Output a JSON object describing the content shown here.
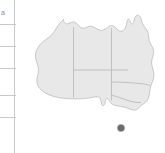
{
  "page": {
    "background_color": "#ffffff",
    "width": 165,
    "height": 153
  },
  "table_fragment": {
    "name": "cropped-table-column",
    "rule_color": "#c9c9c9",
    "cells": [
      {
        "text": "a",
        "top": 9
      },
      {
        "text": "",
        "top": 27
      },
      {
        "text": "",
        "top": 49
      },
      {
        "text": "",
        "top": 71
      },
      {
        "text": "",
        "top": 98
      },
      {
        "text": "",
        "top": 120
      }
    ],
    "row_rules": [
      24,
      46,
      68,
      95,
      117
    ]
  },
  "map": {
    "name": "australia-map",
    "title": "Australia",
    "land_fill": "#e8e8e8",
    "coast_stroke": "#bdbdbd",
    "border_stroke": "#b0b0b0",
    "ocean_fill": "#ffffff",
    "marker": {
      "name": "location-marker",
      "color": "#6b6b6b",
      "cx": 105,
      "cy": 128,
      "r": 3.6
    },
    "regions": [
      {
        "code": "WA",
        "label": "Western Australia"
      },
      {
        "code": "NT",
        "label": "Northern Territory"
      },
      {
        "code": "QLD",
        "label": "Queensland"
      },
      {
        "code": "SA",
        "label": "South Australia"
      },
      {
        "code": "NSW",
        "label": "New South Wales"
      },
      {
        "code": "VIC",
        "label": "Victoria"
      }
    ]
  }
}
